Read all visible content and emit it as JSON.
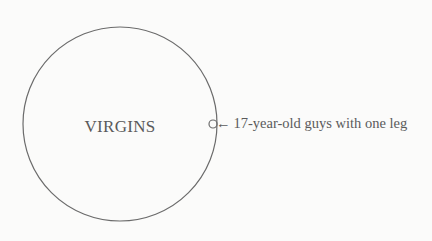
{
  "diagram": {
    "type": "euler",
    "main_set": {
      "label": "VIRGINS"
    },
    "subset": {
      "label": "17-year-old guys with one leg",
      "arrow": "←"
    },
    "colors": {
      "stroke": "#6b6b6b",
      "text": "#5a5a5a",
      "background": "#fbfbfa"
    }
  }
}
